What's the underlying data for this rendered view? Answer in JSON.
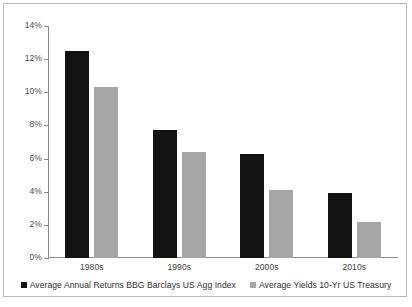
{
  "chart_data": {
    "type": "bar",
    "title": "",
    "subtitle": "",
    "xlabel": "",
    "ylabel": "",
    "categories": [
      "1980s",
      "1990s",
      "2000s",
      "2010s"
    ],
    "series": [
      {
        "name": "Average Annual Returns BBG Barclays US Agg Index",
        "color": "#121212",
        "values": [
          12.5,
          7.7,
          6.3,
          3.9
        ]
      },
      {
        "name": "Average Yields 10-Yr US Treasury",
        "color": "#a6a6a6",
        "values": [
          10.3,
          6.4,
          4.1,
          2.2
        ]
      }
    ],
    "ylim": [
      0,
      14
    ],
    "ytick_values": [
      0,
      2,
      4,
      6,
      8,
      10,
      12,
      14
    ],
    "ytick_labels": [
      "0%",
      "2%",
      "4%",
      "6%",
      "8%",
      "10%",
      "12%",
      "14%"
    ],
    "grid": false,
    "legend_position": "bottom"
  },
  "frame": {
    "border_color": "#b9b9b9",
    "background": "#ffffff",
    "axis_color": "#8a8a8a"
  }
}
